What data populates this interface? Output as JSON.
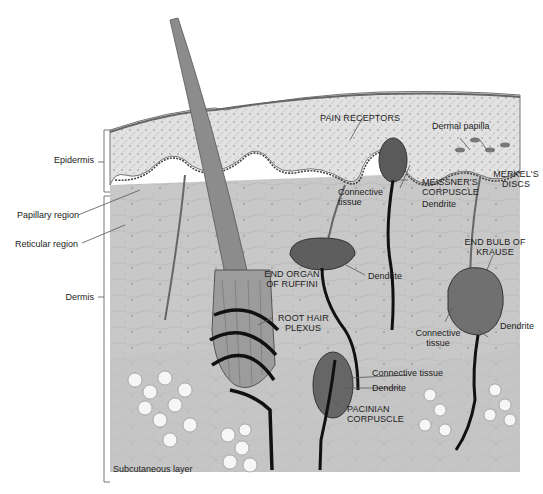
{
  "diagram": {
    "title": "",
    "colors": {
      "background": "#ffffff",
      "dermis": "#c9c9c9",
      "epidermis": "#dedede",
      "receptor": "#7a7a7a",
      "nerve": "#111111",
      "fat_cell": "#f7f7f7"
    },
    "layer_labels": {
      "epidermis": "Epidermis",
      "papillary": "Papillary region",
      "reticular": "Reticular region",
      "dermis": "Dermis",
      "subcutaneous": "Subcutaneous layer"
    },
    "structure_labels": {
      "pain_receptors": "PAIN RECEPTORS",
      "dermal_papilla": "Dermal papilla",
      "meissner_line1": "MEISSNER'S",
      "meissner_line2": "CORPUSCLE",
      "meissner_dendrite": "Dendrite",
      "connective_line1": "Connective",
      "connective_line2": "tissue",
      "merkel_line1": "MERKEL'S",
      "merkel_line2": "DISCS",
      "ruffini_line1": "END ORGAN",
      "ruffini_line2": "OF RUFFINI",
      "ruffini_dendrite": "Dendrite",
      "krause_line1": "END BULB OF",
      "krause_line2": "KRAUSE",
      "krause_connective_line1": "Connective",
      "krause_connective_line2": "tissue",
      "krause_dendrite": "Dendrite",
      "root_hair_line1": "ROOT HAIR",
      "root_hair_line2": "PLEXUS",
      "pacinian_connective": "Connective tissue",
      "pacinian_dendrite": "Dendrite",
      "pacinian_line1": "PACINIAN",
      "pacinian_line2": "CORPUSCLE"
    }
  }
}
